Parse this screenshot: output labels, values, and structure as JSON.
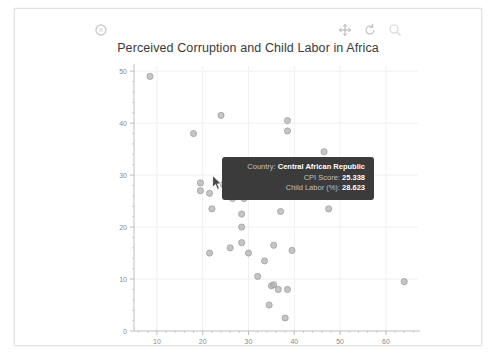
{
  "toolbar": {
    "logo_icon": "circle-logo-icon",
    "buttons": [
      {
        "name": "move-tool",
        "icon": "move-crosshair-icon"
      },
      {
        "name": "reset-tool",
        "icon": "reset-circular-arrow-icon"
      },
      {
        "name": "zoom-tool",
        "icon": "zoom-magnifier-icon"
      }
    ]
  },
  "chart_data": {
    "type": "scatter",
    "title": "Perceived Corruption and Child Labor in Africa",
    "xlabel": "",
    "ylabel": "",
    "xlim": [
      5,
      67
    ],
    "ylim": [
      0,
      51
    ],
    "xticks": [
      10,
      20,
      30,
      40,
      50,
      60
    ],
    "yticks": [
      0,
      10,
      20,
      30,
      40,
      50
    ],
    "grid": true,
    "legend": "none",
    "x_series_name": "CPI Score",
    "y_series_name": "Child Labor (%)",
    "points": [
      {
        "x": 8.5,
        "y": 49.0
      },
      {
        "x": 18.0,
        "y": 38.0
      },
      {
        "x": 24.0,
        "y": 41.5
      },
      {
        "x": 38.5,
        "y": 40.5
      },
      {
        "x": 38.5,
        "y": 38.5
      },
      {
        "x": 46.5,
        "y": 34.5
      },
      {
        "x": 19.5,
        "y": 28.5
      },
      {
        "x": 19.5,
        "y": 27.0
      },
      {
        "x": 21.5,
        "y": 26.5
      },
      {
        "x": 22.0,
        "y": 23.5
      },
      {
        "x": 24.5,
        "y": 28.2
      },
      {
        "x": 25.3,
        "y": 28.6
      },
      {
        "x": 25.9,
        "y": 28.0
      },
      {
        "x": 26.5,
        "y": 25.5
      },
      {
        "x": 28.5,
        "y": 22.5
      },
      {
        "x": 28.5,
        "y": 27.0
      },
      {
        "x": 29.0,
        "y": 26.5
      },
      {
        "x": 29.0,
        "y": 25.5
      },
      {
        "x": 31.0,
        "y": 26.5
      },
      {
        "x": 37.0,
        "y": 30.0
      },
      {
        "x": 37.0,
        "y": 23.0
      },
      {
        "x": 47.5,
        "y": 23.5
      },
      {
        "x": 28.5,
        "y": 20.0
      },
      {
        "x": 21.5,
        "y": 15.0
      },
      {
        "x": 26.0,
        "y": 16.0
      },
      {
        "x": 28.5,
        "y": 17.0
      },
      {
        "x": 30.0,
        "y": 15.0
      },
      {
        "x": 33.5,
        "y": 13.5
      },
      {
        "x": 35.5,
        "y": 16.5
      },
      {
        "x": 39.5,
        "y": 15.5
      },
      {
        "x": 32.0,
        "y": 10.5
      },
      {
        "x": 35.0,
        "y": 8.7
      },
      {
        "x": 35.5,
        "y": 8.9
      },
      {
        "x": 36.5,
        "y": 8.0
      },
      {
        "x": 38.5,
        "y": 8.0
      },
      {
        "x": 34.5,
        "y": 5.0
      },
      {
        "x": 38.0,
        "y": 2.5
      },
      {
        "x": 64.0,
        "y": 9.5
      }
    ]
  },
  "tooltip": {
    "visible": true,
    "rows": [
      {
        "key": "Country:",
        "value": "Central African Republic"
      },
      {
        "key": "CPI Score:",
        "value": "25.338"
      },
      {
        "key": "Child Labor (%):",
        "value": "28.623"
      }
    ]
  },
  "colors": {
    "point": "#b2b2b2",
    "grid": "#f0f0f0",
    "axis": "#bdbdbd",
    "tooltip_bg": "#3b3b3b",
    "title_text": "#3a3a3a"
  }
}
